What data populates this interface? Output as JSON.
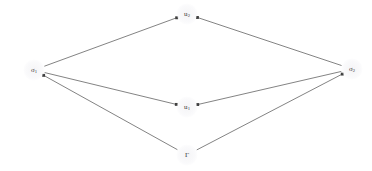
{
  "figure": {
    "type": "directed-graph-diagram",
    "background_color": "#ffffff",
    "edge_color": "#3f3f3f",
    "label_color": "#3a3a3a",
    "width": 372,
    "height": 171
  },
  "nodes": [
    {
      "id": "sigma1",
      "base": "σ",
      "subscript": "1",
      "label": "σ₁",
      "x": 34,
      "y": 70
    },
    {
      "id": "u2",
      "base": "u",
      "subscript": "2",
      "label": "u₂",
      "x": 187,
      "y": 14
    },
    {
      "id": "u1",
      "base": "u",
      "subscript": "1",
      "label": "u₁",
      "x": 187,
      "y": 107
    },
    {
      "id": "sigma2",
      "base": "σ",
      "subscript": "2",
      "label": "σ₂",
      "x": 352,
      "y": 69
    },
    {
      "id": "gamma",
      "base": "Γ",
      "subscript": "",
      "label": "Γ",
      "x": 187,
      "y": 155
    }
  ],
  "edges": [
    {
      "id": "edge-sigma1-u2",
      "from": "sigma1",
      "to": "u2",
      "directed": true,
      "arrow_at": "to"
    },
    {
      "id": "edge-sigma2-u2",
      "from": "sigma2",
      "to": "u2",
      "directed": true,
      "arrow_at": "to"
    },
    {
      "id": "edge-sigma1-u1",
      "from": "sigma1",
      "to": "u1",
      "directed": true,
      "arrow_at": "to"
    },
    {
      "id": "edge-sigma2-u1",
      "from": "sigma2",
      "to": "u1",
      "directed": true,
      "arrow_at": "to"
    },
    {
      "id": "edge-gamma-sigma1",
      "from": "gamma",
      "to": "sigma1",
      "directed": true,
      "arrow_at": "to"
    },
    {
      "id": "edge-gamma-sigma2",
      "from": "gamma",
      "to": "sigma2",
      "directed": true,
      "arrow_at": "to"
    }
  ],
  "chart_data": {
    "type": "diagram",
    "title": "",
    "nodes": [
      "σ₁",
      "u₂",
      "u₁",
      "σ₂",
      "Γ"
    ],
    "directed_edges": [
      [
        "σ₁",
        "u₂"
      ],
      [
        "σ₂",
        "u₂"
      ],
      [
        "σ₁",
        "u₁"
      ],
      [
        "σ₂",
        "u₁"
      ],
      [
        "Γ",
        "σ₁"
      ],
      [
        "Γ",
        "σ₂"
      ]
    ]
  }
}
